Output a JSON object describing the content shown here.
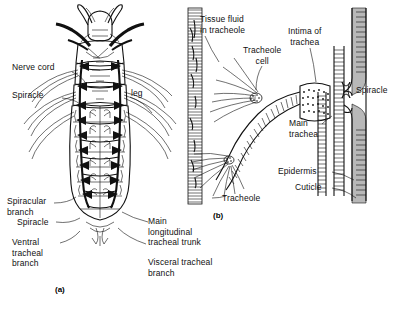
{
  "figure": {
    "panels": [
      {
        "id": "a",
        "caption": "(a)",
        "description": "Dorsal view of insect larva showing tracheal system"
      },
      {
        "id": "b",
        "caption": "(b)",
        "description": "Detail of tracheoles, trachea, spiracle, epidermis and cuticle"
      }
    ]
  },
  "panel_a": {
    "caption": "(a)",
    "labels": {
      "nerve_cord": "Nerve cord",
      "spiracle_upper": "Spiracle",
      "leg": "leg",
      "spiracular_branch": "Spiracular\nbranch",
      "spiracle_lower": "Spiracle",
      "ventral_tracheal_branch": "Ventral\ntracheal\nbranch",
      "main_longitudinal_tracheal_trunk": "Main\nlongitudinal\ntracheal trunk",
      "visceral_tracheal_branch": "Visceral tracheal\nbranch"
    }
  },
  "panel_b": {
    "caption": "(b)",
    "labels": {
      "tissue_fluid_in_tracheole": "Tissue fluid\nin tracheole",
      "tracheole_cell": "Tracheole\ncell",
      "intima_of_trachea": "Intima of\ntrachea",
      "spiracle": "Spiracle",
      "main_trachea": "Main\ntrachea",
      "epidermis": "Epidermis",
      "cuticle": "Cuticle",
      "tracheole": "Tracheole"
    }
  },
  "colors": {
    "ink": "#111111",
    "paper": "#ffffff",
    "shading": "#b8b8b8"
  }
}
